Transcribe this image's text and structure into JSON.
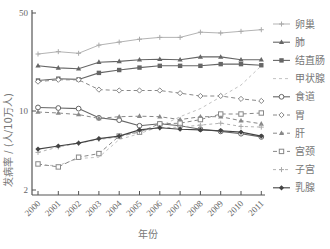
{
  "chart_data": {
    "type": "line",
    "title": "",
    "xlabel": "年份",
    "ylabel": "发病率 / (人/10万人)",
    "yscale": "log",
    "ylim": [
      2,
      50
    ],
    "yticks": [
      2,
      10,
      50
    ],
    "x": [
      "2000",
      "2001",
      "2002",
      "2003",
      "2004",
      "2005",
      "2006",
      "2007",
      "2008",
      "2009",
      "2010",
      "2011"
    ],
    "grid": false,
    "legend_position": "right",
    "series": [
      {
        "name": "卵巢",
        "style": "solid-light",
        "marker": "plus",
        "color": "#aaaaaa",
        "values": [
          25.5,
          26.5,
          25.8,
          29.5,
          31,
          32.5,
          33.5,
          33.5,
          36.5,
          36,
          37,
          38
        ]
      },
      {
        "name": "肺",
        "style": "solid",
        "marker": "triangle",
        "color": "#666666",
        "values": [
          21,
          20.3,
          20,
          22.3,
          22.6,
          23.2,
          23.4,
          23.2,
          24.3,
          24.3,
          23.2,
          23.2
        ]
      },
      {
        "name": "结直肠",
        "style": "solid",
        "marker": "filled-square",
        "color": "#666666",
        "values": [
          16.5,
          17,
          16.8,
          18.7,
          19.6,
          20.4,
          21,
          21,
          21,
          21.6,
          21.6,
          21.2
        ]
      },
      {
        "name": "甲状腺",
        "style": "dashed-light",
        "marker": "none",
        "color": "#bbbbbb",
        "values": [
          3.3,
          3.3,
          3.8,
          3.9,
          5.6,
          6.3,
          7.3,
          8.9,
          10.4,
          12.6,
          15.3,
          21
        ]
      },
      {
        "name": "食道",
        "style": "solid",
        "marker": "open-circle",
        "color": "#666666",
        "values": [
          10.6,
          10.5,
          10.4,
          8.7,
          8.3,
          7.4,
          7.7,
          7.4,
          6.9,
          6.6,
          6.3,
          5.9
        ]
      },
      {
        "name": "胃",
        "style": "dashed",
        "marker": "open-diamond",
        "color": "#888888",
        "values": [
          16.2,
          16.7,
          16.7,
          14.2,
          14,
          14,
          14,
          13.4,
          12.8,
          12.8,
          12.2,
          11.8
        ]
      },
      {
        "name": "肝",
        "style": "dashed",
        "marker": "triangle",
        "color": "#888888",
        "values": [
          9.8,
          9.6,
          9.3,
          8.6,
          8.9,
          9,
          8.9,
          8.4,
          8.9,
          8.9,
          8.2,
          7.7
        ]
      },
      {
        "name": "宫颈",
        "style": "dashed",
        "marker": "open-square",
        "color": "#888888",
        "values": [
          3.4,
          3.2,
          3.9,
          4.2,
          6,
          6.5,
          7.7,
          7.8,
          8.4,
          9.4,
          9.4,
          9.6
        ]
      },
      {
        "name": "子宫",
        "style": "dashed-light",
        "marker": "plus",
        "color": "#aaaaaa",
        "values": [
          4.3,
          4.8,
          5.2,
          5.6,
          5.9,
          6.6,
          7.1,
          7.2,
          7.5,
          7.8,
          7.3,
          7.2
        ]
      },
      {
        "name": "乳腺",
        "style": "solid",
        "marker": "filled-diamond",
        "color": "#444444",
        "values": [
          4.6,
          4.9,
          5.2,
          5.7,
          6,
          6.8,
          7.1,
          6.9,
          6.8,
          6.7,
          6.5,
          6.0
        ]
      }
    ]
  },
  "axes": {
    "xlabel": "年份",
    "ylabel": "发病率 / (人/10万人)",
    "ytick_labels": [
      "50",
      "10",
      "2"
    ],
    "xtick_labels": [
      "2000",
      "2001",
      "2002",
      "2003",
      "2004",
      "2005",
      "2006",
      "2007",
      "2008",
      "2009",
      "2010",
      "2011"
    ]
  },
  "legend": [
    "卵巢",
    "肺",
    "结直肠",
    "甲状腺",
    "食道",
    "胃",
    "肝",
    "宫颈",
    "子宫",
    "乳腺"
  ]
}
